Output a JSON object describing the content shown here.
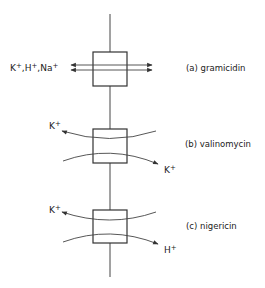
{
  "diagram": {
    "type": "ionophore-membrane-transport",
    "membrane": {
      "x": 110,
      "y_top": 14,
      "y_bottom": 277
    },
    "colors": {
      "stroke": "#333333",
      "background": "#ffffff",
      "text": "#222222"
    },
    "panels": [
      {
        "id": "a",
        "label": "(a) gramicidin",
        "mechanism": "channel",
        "box": {
          "x": 93,
          "y": 52,
          "w": 34,
          "h": 34
        },
        "ions_left": [
          {
            "symbol": "K",
            "charge": "+"
          },
          {
            "symbol": "H",
            "charge": "+"
          },
          {
            "symbol": "Na",
            "charge": "+"
          }
        ],
        "ions_left_text": "K+, H+, Na+"
      },
      {
        "id": "b",
        "label": "(b) valinomycin",
        "mechanism": "carrier",
        "box": {
          "x": 93,
          "y": 129,
          "w": 34,
          "h": 34
        },
        "ion_upper_left": {
          "symbol": "K",
          "charge": "+"
        },
        "ion_lower_right": {
          "symbol": "K",
          "charge": "+"
        }
      },
      {
        "id": "c",
        "label": "(c) nigericin",
        "mechanism": "antiporter",
        "box": {
          "x": 93,
          "y": 210,
          "w": 34,
          "h": 33
        },
        "ion_upper_left": {
          "symbol": "K",
          "charge": "+"
        },
        "ion_lower_right": {
          "symbol": "H",
          "charge": "+"
        }
      }
    ]
  }
}
